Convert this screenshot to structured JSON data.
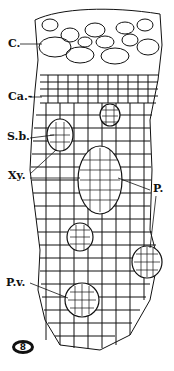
{
  "figure": {
    "figure_number": "8",
    "labels": [
      {
        "id": "C",
        "text": "C.",
        "x": 8,
        "y": 38
      },
      {
        "id": "Ca",
        "text": "Ca.-",
        "x": 8,
        "y": 90
      },
      {
        "id": "Sb",
        "text": "S.b.",
        "x": 7,
        "y": 127
      },
      {
        "id": "Xy",
        "text": "Xy.",
        "x": 8,
        "y": 168
      },
      {
        "id": "P",
        "text": "P.",
        "x": 153,
        "y": 183
      },
      {
        "id": "Pv",
        "text": "P.v.",
        "x": 6,
        "y": 277
      }
    ],
    "colors": {
      "ink": "#111111",
      "paper": "#ffffff"
    }
  }
}
